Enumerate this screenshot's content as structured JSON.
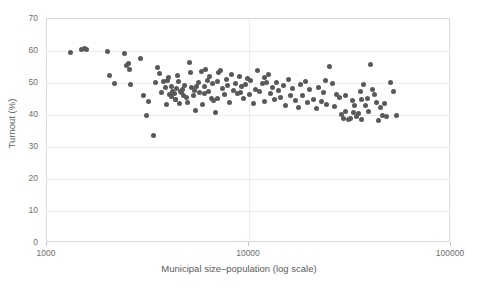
{
  "chart_data": {
    "type": "scatter",
    "title": "",
    "xlabel": "Municipal size–population (log scale)",
    "ylabel": "Turnout (%)",
    "x_scale": "log",
    "xlim": [
      1000,
      100000
    ],
    "ylim": [
      0,
      70
    ],
    "xticks": [
      1000,
      10000,
      100000
    ],
    "xtick_labels": [
      "1000",
      "10000",
      "100000"
    ],
    "yticks": [
      0,
      10,
      20,
      30,
      40,
      50,
      60,
      70
    ],
    "ytick_labels": [
      "0",
      "10",
      "20",
      "30",
      "40",
      "50",
      "60",
      "70"
    ],
    "grid": "horizontal-and-vertical",
    "legend": "none",
    "marker_color": "#595959",
    "marker_size_px": 5,
    "n_points": 152,
    "points": [
      [
        1310,
        59.4
      ],
      [
        1480,
        60.5
      ],
      [
        1540,
        60.8
      ],
      [
        1570,
        60.6
      ],
      [
        1990,
        59.7
      ],
      [
        2030,
        52.3
      ],
      [
        2150,
        50.0
      ],
      [
        2420,
        59.1
      ],
      [
        2480,
        55.5
      ],
      [
        2520,
        56.0
      ],
      [
        2560,
        54.3
      ],
      [
        2600,
        49.6
      ],
      [
        2900,
        57.6
      ],
      [
        3020,
        46.2
      ],
      [
        3100,
        39.8
      ],
      [
        3180,
        44.2
      ],
      [
        3350,
        33.6
      ],
      [
        3450,
        50.1
      ],
      [
        3520,
        55.0
      ],
      [
        3600,
        52.9
      ],
      [
        3700,
        47.0
      ],
      [
        3780,
        50.5
      ],
      [
        3850,
        48.6
      ],
      [
        3900,
        43.4
      ],
      [
        3950,
        50.7
      ],
      [
        4050,
        46.3
      ],
      [
        4120,
        45.8
      ],
      [
        4200,
        47.2
      ],
      [
        4260,
        46.6
      ],
      [
        4310,
        44.9
      ],
      [
        4380,
        48.2
      ],
      [
        4430,
        52.4
      ],
      [
        4500,
        50.6
      ],
      [
        4560,
        47.5
      ],
      [
        4620,
        46.9
      ],
      [
        4700,
        48.0
      ],
      [
        4760,
        46.1
      ],
      [
        4820,
        49.3
      ],
      [
        4900,
        45.4
      ],
      [
        4960,
        43.8
      ],
      [
        5050,
        56.3
      ],
      [
        5150,
        53.2
      ],
      [
        5220,
        48.5
      ],
      [
        5300,
        46.0
      ],
      [
        5380,
        47.8
      ],
      [
        5460,
        41.5
      ],
      [
        5520,
        49.0
      ],
      [
        5600,
        50.2
      ],
      [
        5700,
        47.1
      ],
      [
        5800,
        53.6
      ],
      [
        5900,
        43.2
      ],
      [
        6000,
        48.9
      ],
      [
        6100,
        54.1
      ],
      [
        6200,
        50.9
      ],
      [
        6300,
        47.4
      ],
      [
        6400,
        52.0
      ],
      [
        6500,
        45.2
      ],
      [
        6600,
        49.7
      ],
      [
        6700,
        44.5
      ],
      [
        6800,
        40.8
      ],
      [
        6950,
        50.4
      ],
      [
        7100,
        53.3
      ],
      [
        7250,
        53.8
      ],
      [
        7400,
        48.3
      ],
      [
        7550,
        46.4
      ],
      [
        7700,
        51.2
      ],
      [
        7850,
        49.1
      ],
      [
        8000,
        44.0
      ],
      [
        8200,
        52.6
      ],
      [
        8400,
        47.7
      ],
      [
        8600,
        50.0
      ],
      [
        8800,
        46.8
      ],
      [
        9000,
        52.1
      ],
      [
        9200,
        48.8
      ],
      [
        9400,
        45.1
      ],
      [
        9600,
        49.4
      ],
      [
        9800,
        51.5
      ],
      [
        10000,
        46.5
      ],
      [
        10200,
        50.8
      ],
      [
        10500,
        43.6
      ],
      [
        10800,
        48.1
      ],
      [
        11000,
        54.0
      ],
      [
        11300,
        47.3
      ],
      [
        11600,
        49.9
      ],
      [
        11900,
        44.3
      ],
      [
        12200,
        50.3
      ],
      [
        12500,
        52.8
      ],
      [
        12800,
        46.7
      ],
      [
        13100,
        48.7
      ],
      [
        13400,
        44.8
      ],
      [
        13700,
        50.1
      ],
      [
        14000,
        47.6
      ],
      [
        14400,
        45.5
      ],
      [
        14800,
        49.2
      ],
      [
        15200,
        43.0
      ],
      [
        15600,
        51.0
      ],
      [
        16000,
        46.2
      ],
      [
        16500,
        48.4
      ],
      [
        17000,
        44.6
      ],
      [
        17500,
        42.2
      ],
      [
        18000,
        49.5
      ],
      [
        18500,
        46.0
      ],
      [
        19000,
        50.6
      ],
      [
        19500,
        43.9
      ],
      [
        20000,
        47.9
      ],
      [
        20800,
        45.0
      ],
      [
        21500,
        41.9
      ],
      [
        22000,
        48.6
      ],
      [
        22800,
        44.1
      ],
      [
        23500,
        47.0
      ],
      [
        24200,
        43.3
      ],
      [
        25000,
        55.2
      ],
      [
        25800,
        49.8
      ],
      [
        26500,
        42.7
      ],
      [
        27200,
        46.5
      ],
      [
        28000,
        45.6
      ],
      [
        28800,
        40.2
      ],
      [
        29500,
        39.0
      ],
      [
        30200,
        41.2
      ],
      [
        31000,
        38.5
      ],
      [
        31800,
        38.9
      ],
      [
        32500,
        44.4
      ],
      [
        33200,
        42.9
      ],
      [
        34000,
        39.6
      ],
      [
        34800,
        40.5
      ],
      [
        35500,
        47.5
      ],
      [
        36200,
        44.7
      ],
      [
        37000,
        49.6
      ],
      [
        37800,
        43.1
      ],
      [
        38500,
        45.3
      ],
      [
        39200,
        41.0
      ],
      [
        40000,
        55.8
      ],
      [
        41000,
        48.0
      ],
      [
        42000,
        46.3
      ],
      [
        43000,
        44.0
      ],
      [
        44000,
        38.2
      ],
      [
        45000,
        42.4
      ],
      [
        46000,
        40.0
      ],
      [
        47000,
        43.5
      ],
      [
        48000,
        39.4
      ],
      [
        50000,
        50.2
      ],
      [
        52000,
        47.2
      ],
      [
        54000,
        39.8
      ],
      [
        4000,
        51.8
      ],
      [
        4150,
        49.0
      ],
      [
        4350,
        45.0
      ],
      [
        4550,
        43.5
      ],
      [
        6050,
        46.6
      ],
      [
        7000,
        45.3
      ],
      [
        9100,
        47.0
      ],
      [
        12000,
        51.8
      ],
      [
        24000,
        50.9
      ],
      [
        30000,
        46.0
      ],
      [
        33000,
        40.7
      ],
      [
        36000,
        38.7
      ]
    ]
  }
}
